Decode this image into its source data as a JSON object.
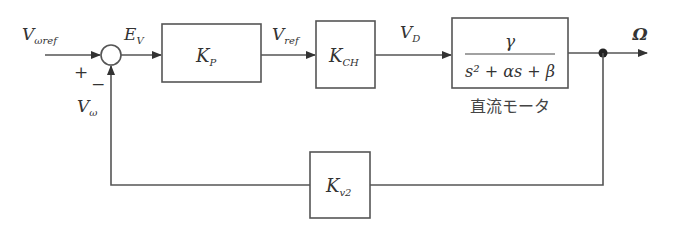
{
  "diagram": {
    "type": "block-diagram",
    "title": "",
    "signals": {
      "input": {
        "main": "V",
        "sub": "ωref"
      },
      "error": {
        "main": "E",
        "sub": "V"
      },
      "feedback": {
        "main": "V",
        "sub": "ω"
      },
      "ref": {
        "main": "V",
        "sub": "ref"
      },
      "drive": {
        "main": "V",
        "sub": "D"
      },
      "output": {
        "main": "Ω"
      }
    },
    "junction_signs": {
      "plus": "+",
      "minus": "−"
    },
    "blocks": {
      "kp": {
        "main": "K",
        "sub": "P"
      },
      "kch": {
        "main": "K",
        "sub": "CH"
      },
      "motor": {
        "numerator": "γ",
        "denominator": "s² + αs + β",
        "caption": "直流モータ"
      },
      "kv2": {
        "main": "K",
        "sub": "v2"
      }
    },
    "connections": [
      [
        "input",
        "junction(+)"
      ],
      [
        "junction",
        "K_P"
      ],
      [
        "K_P",
        "K_CH"
      ],
      [
        "K_CH",
        "motor"
      ],
      [
        "motor",
        "output Ω"
      ],
      [
        "output branch",
        "K_v2"
      ],
      [
        "K_v2",
        "junction(−)"
      ]
    ]
  }
}
